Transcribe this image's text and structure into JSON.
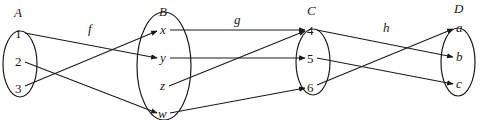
{
  "diagram": {
    "type": "function-composition-mapping",
    "sets": [
      {
        "id": "A",
        "label": "A",
        "elements": [
          "1",
          "2",
          "3"
        ],
        "italic": false
      },
      {
        "id": "B",
        "label": "B",
        "elements": [
          "x",
          "y",
          "z",
          "w"
        ],
        "italic": true
      },
      {
        "id": "C",
        "label": "C",
        "elements": [
          "4",
          "5",
          "6"
        ],
        "italic": false
      },
      {
        "id": "D",
        "label": "D",
        "elements": [
          "a",
          "b",
          "c"
        ],
        "italic": true
      }
    ],
    "functions": [
      {
        "label": "f",
        "from": "A",
        "to": "B",
        "mappings": [
          [
            "1",
            "y"
          ],
          [
            "2",
            "w"
          ],
          [
            "3",
            "x"
          ]
        ]
      },
      {
        "label": "g",
        "from": "B",
        "to": "C",
        "mappings": [
          [
            "x",
            "4"
          ],
          [
            "y",
            "5"
          ],
          [
            "z",
            "4"
          ],
          [
            "w",
            "6"
          ]
        ]
      },
      {
        "label": "h",
        "from": "C",
        "to": "D",
        "mappings": [
          [
            "4",
            "b"
          ],
          [
            "5",
            "c"
          ],
          [
            "6",
            "a"
          ]
        ]
      }
    ]
  }
}
